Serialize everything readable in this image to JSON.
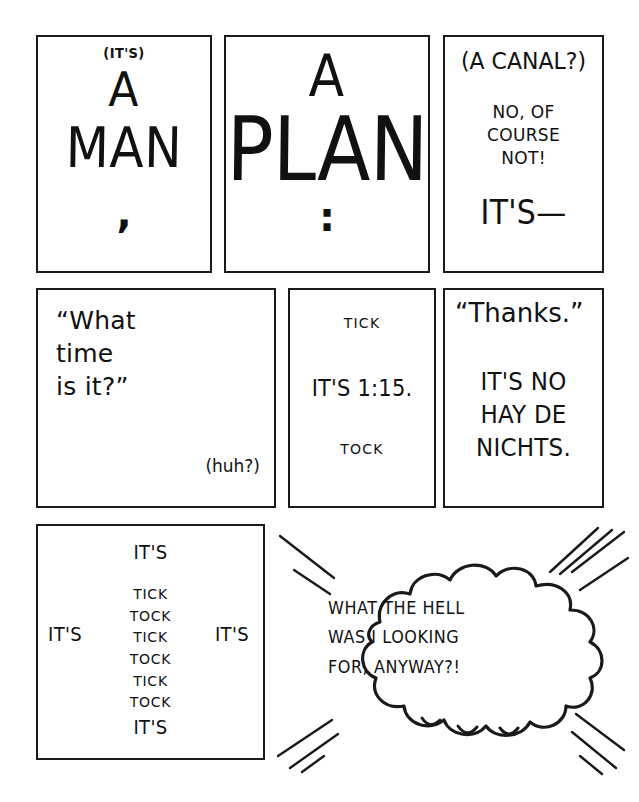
{
  "comic": {
    "panels": [
      {
        "id": "panel-1",
        "lines": {
          "aside": "(IT'S)",
          "word1": "A",
          "word2": "MAN",
          "punct": ","
        }
      },
      {
        "id": "panel-2",
        "lines": {
          "word1": "A",
          "word2": "PLAN",
          "punct": ":"
        }
      },
      {
        "id": "panel-3",
        "lines": {
          "aside": "(A CANAL?)",
          "reply": "NO, OF\nCOURSE\nNOT!",
          "tag": "IT'S—"
        }
      },
      {
        "id": "panel-4",
        "lines": {
          "question": "“What\ntime\nis it?”",
          "aside": "(huh?)"
        }
      },
      {
        "id": "panel-5",
        "lines": {
          "sfx_top": "TICK",
          "answer": "IT'S 1:15.",
          "sfx_bottom": "TOCK"
        }
      },
      {
        "id": "panel-6",
        "lines": {
          "thanks": "“Thanks.”",
          "reply": "IT'S NO\nHAY DE\nNICHTS."
        }
      },
      {
        "id": "panel-7",
        "lines": {
          "top": "IT'S",
          "left": "IT'S",
          "right": "IT'S",
          "bottom": "IT'S",
          "ticktock": "TICK\nTOCK\nTICK\nTOCK\nTICK\nTOCK"
        }
      },
      {
        "id": "panel-8",
        "lines": {
          "thought": "WHAT THE HELL\nWAS I LOOKING\nFOR, ANYWAY?!"
        }
      }
    ]
  },
  "style": {
    "ink": "#1a1a1a",
    "paper": "#ffffff"
  }
}
